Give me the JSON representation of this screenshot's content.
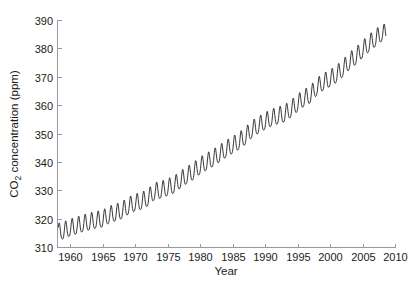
{
  "chart_data": {
    "type": "line",
    "title": "",
    "subtitle": "",
    "xlabel": "Year",
    "ylabel": "CO2 concentration (ppm)",
    "ylabel_parts": {
      "prefix": "CO",
      "subscript": "2",
      "suffix": " concentration (ppm)"
    },
    "xlim": [
      1958.0,
      2010.0
    ],
    "ylim": [
      310,
      390
    ],
    "xticks": [
      1960,
      1965,
      1970,
      1975,
      1980,
      1985,
      1990,
      1995,
      2000,
      2005,
      2010
    ],
    "xtick_labels": [
      "1960",
      "1965",
      "1970",
      "1975",
      "1980",
      "1985",
      "1990",
      "1995",
      "2000",
      "2005",
      "2010"
    ],
    "yticks": [
      310,
      320,
      330,
      340,
      350,
      360,
      370,
      380,
      390
    ],
    "ytick_labels": [
      "310",
      "320",
      "330",
      "340",
      "350",
      "360",
      "370",
      "380",
      "390"
    ],
    "grid": false,
    "legend": null,
    "legend_position": "none",
    "line_color": "#111111",
    "axis_color": "#9a9a9a",
    "series": [
      {
        "name": "Atmospheric CO2 (Mauna Loa monthly mean)",
        "seasonal_amplitude_ppm": 6.0,
        "seasonal_peak_month": 5,
        "seasonal_trough_month": 10,
        "trend_annual": {
          "x": [
            1958,
            1959,
            1960,
            1961,
            1962,
            1963,
            1964,
            1965,
            1966,
            1967,
            1968,
            1969,
            1970,
            1971,
            1972,
            1973,
            1974,
            1975,
            1976,
            1977,
            1978,
            1979,
            1980,
            1981,
            1982,
            1983,
            1984,
            1985,
            1986,
            1987,
            1988,
            1989,
            1990,
            1991,
            1992,
            1993,
            1994,
            1995,
            1996,
            1997,
            1998,
            1999,
            2000,
            2001,
            2002,
            2003,
            2004,
            2005,
            2006,
            2007,
            2008
          ],
          "y": [
            315.3,
            315.9,
            316.9,
            317.6,
            318.4,
            319.0,
            319.6,
            320.0,
            321.4,
            322.2,
            323.0,
            324.6,
            325.7,
            326.3,
            327.5,
            329.7,
            330.2,
            331.1,
            332.0,
            333.8,
            335.4,
            336.8,
            338.7,
            340.1,
            341.4,
            343.0,
            344.6,
            346.0,
            347.4,
            349.2,
            351.6,
            353.1,
            354.4,
            355.6,
            356.4,
            357.1,
            358.8,
            360.8,
            362.6,
            363.8,
            366.6,
            368.3,
            369.5,
            371.0,
            373.1,
            375.6,
            377.4,
            379.7,
            381.9,
            383.7,
            385.6
          ]
        }
      }
    ]
  },
  "axes_geometry": {
    "plot_left_px": 57,
    "plot_right_px": 395,
    "plot_top_px": 20,
    "plot_bottom_px": 247
  }
}
